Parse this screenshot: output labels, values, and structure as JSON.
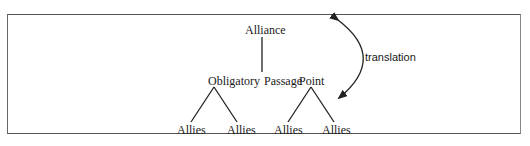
{
  "diagram": {
    "nodes": {
      "alliance": "Alliance",
      "opp_1": "Obligatory",
      "opp_2": "Passage",
      "opp_3": "Point",
      "allies": [
        "Allies",
        "Allies",
        "Allies",
        "Allies"
      ]
    },
    "edge_labels": {
      "translation": "translation"
    },
    "edges": [
      {
        "from": "Alliance",
        "to": "Obligatory Passage Point",
        "type": "line"
      },
      {
        "from": "Obligatory",
        "to": "Allies (1)",
        "type": "line"
      },
      {
        "from": "Obligatory",
        "to": "Allies (2)",
        "type": "line"
      },
      {
        "from": "Point",
        "to": "Allies (3)",
        "type": "line"
      },
      {
        "from": "Point",
        "to": "Allies (4)",
        "type": "line"
      },
      {
        "from": "Alliance level",
        "to": "Allies level",
        "type": "curved double arrow",
        "label": "translation"
      }
    ]
  }
}
